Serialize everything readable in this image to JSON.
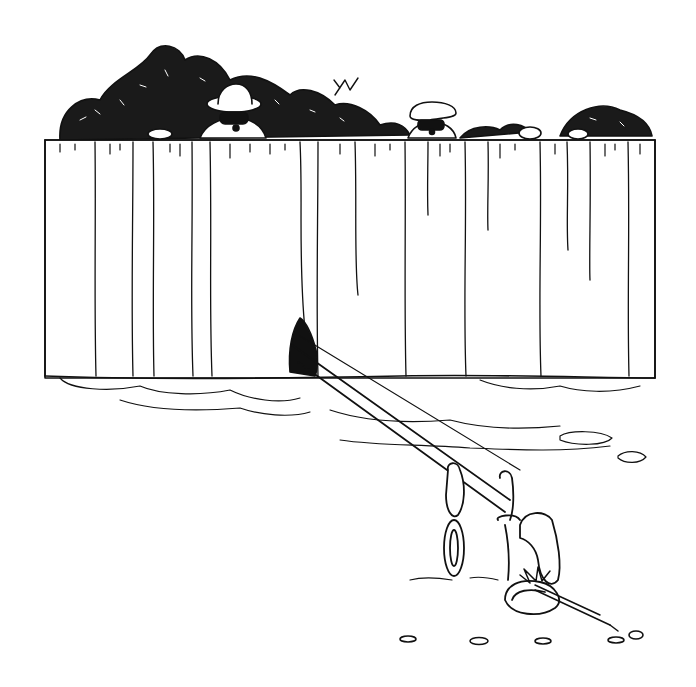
{
  "image": {
    "description": "Black-and-white pen illustration: two masked figures (one in a pith helmet, one in a flat cap) peer over a tall wooden plank fence backed by dense bushes. A long pole/rod extends from a hole at the base of the fence across bare ground to a trap-like contraption with chain links and a clamp, baited with a carrot.",
    "palette": {
      "ink": "#111111",
      "paper": "#ffffff"
    },
    "elements": [
      "bushes",
      "figure-pith-helmet",
      "figure-flat-cap",
      "plank-fence",
      "fence-hole",
      "pole",
      "chain-links",
      "trap-clamp",
      "carrot-bait",
      "ground-patches",
      "pebbles"
    ]
  }
}
